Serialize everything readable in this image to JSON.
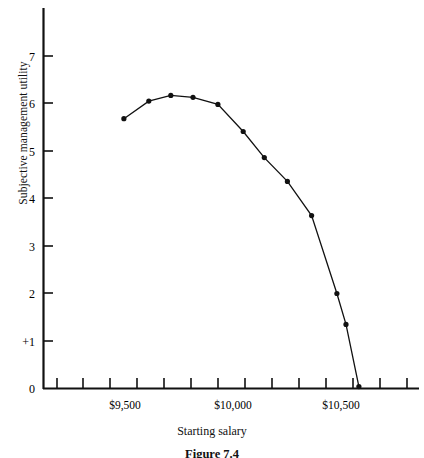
{
  "figure": {
    "caption": "Figure 7.4",
    "xlabel": "Starting salary",
    "ylabel": "Subjective management utility"
  },
  "axes": {
    "y_tick_labels": [
      "7",
      "6",
      "5",
      "4",
      "3",
      "2",
      "+1",
      "0"
    ],
    "x_tick_labels": [
      "$9,500",
      "$10,000",
      "$10,500"
    ]
  },
  "chart_data": {
    "type": "line",
    "title": "Figure 7.4",
    "xlabel": "Starting salary",
    "ylabel": "Subjective management utility",
    "grid": false,
    "legend": false,
    "marker": "filled-circle",
    "line_color": "#111111",
    "marker_color": "#111111",
    "xlim": [
      9310,
      10870
    ],
    "ylim": [
      0,
      7.6
    ],
    "yticks": [
      0,
      1,
      2,
      3,
      4,
      5,
      6,
      7
    ],
    "ytick_labels": [
      "0",
      "+1",
      "2",
      "3",
      "4",
      "5",
      "6",
      "7"
    ],
    "xticks": [
      9500,
      10000,
      10500
    ],
    "xtick_labels": [
      "$9,500",
      "$10,000",
      "$10,500"
    ],
    "x_minor_tick_spacing": 125,
    "series": [
      {
        "name": "Subjective management utility",
        "x": [
          9495,
          9610,
          9712,
          9815,
          9930,
          10047,
          10145,
          10252,
          10364,
          10481,
          10523,
          10583
        ],
        "y": [
          5.68,
          6.05,
          6.17,
          6.13,
          5.98,
          5.41,
          4.86,
          4.36,
          3.64,
          2.0,
          1.35,
          0.04
        ]
      }
    ],
    "points_px": [
      {
        "x": 83,
        "y": 118
      },
      {
        "x": 108,
        "y": 101
      },
      {
        "x": 130,
        "y": 95
      },
      {
        "x": 152,
        "y": 97
      },
      {
        "x": 177,
        "y": 104
      },
      {
        "x": 202,
        "y": 131
      },
      {
        "x": 223,
        "y": 157
      },
      {
        "x": 246,
        "y": 181
      },
      {
        "x": 270,
        "y": 215
      },
      {
        "x": 295,
        "y": 293
      },
      {
        "x": 304,
        "y": 324
      },
      {
        "x": 317,
        "y": 386
      }
    ]
  }
}
